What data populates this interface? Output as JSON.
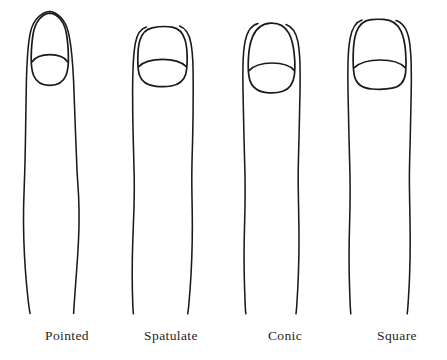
{
  "figure": {
    "background_color": "#ffffff",
    "ink_color": "#1c1a18",
    "width": 447,
    "height": 360
  },
  "items": [
    {
      "label": "Pointed",
      "nail_shape": "narrow elongated oval tapering to a point",
      "finger_index": 1
    },
    {
      "label": "Spatulate",
      "nail_shape": "wide flat-topped rectangle with rounded corners",
      "finger_index": 2
    },
    {
      "label": "Conic",
      "nail_shape": "tall rounded oval narrowing toward the tip",
      "finger_index": 3
    },
    {
      "label": "Square",
      "nail_shape": "broad square with gently rounded top corners",
      "finger_index": 4
    }
  ],
  "icons": {
    "finger": "finger-outline-icon",
    "nail": "nail-outline-icon"
  }
}
